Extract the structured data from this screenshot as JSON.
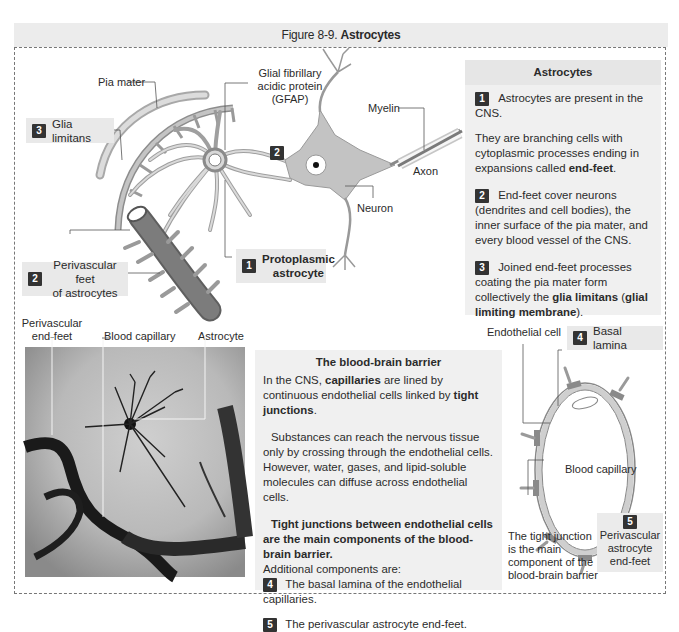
{
  "figure": {
    "title_prefix": "Figure 8-9.",
    "title_bold": "Astrocytes"
  },
  "diagram_labels": {
    "pia_mater": "Pia mater",
    "gfap_line1": "Glial fibrillary",
    "gfap_line2": "acidic protein",
    "gfap_line3": "(GFAP)",
    "myelin": "Myelin",
    "axon": "Axon",
    "neuron": "Neuron",
    "glia_limitans": {
      "badge": "3",
      "text": "Glia limitans"
    },
    "neuron_badge": "2",
    "perivascular_feet": {
      "badge": "2",
      "line1": "Perivascular feet",
      "line2": "of astrocytes"
    },
    "protoplasmic_astrocyte": {
      "badge": "1",
      "line1": "Protoplasmic",
      "line2": "astrocyte"
    }
  },
  "astrocytes_panel": {
    "header": "Astrocytes",
    "item1": {
      "badge": "1",
      "text": "Astrocytes are present in the CNS."
    },
    "para1_a": "They are branching cells with cytoplasmic processes ending in expansions called ",
    "para1_b": "end-feet",
    "para1_c": ".",
    "item2": {
      "badge": "2",
      "text": "End-feet cover neurons (dendrites and cell bodies), the inner surface of the pia mater, and every blood vessel of the CNS."
    },
    "item3": {
      "badge": "3",
      "text_a": "Joined end-feet processes coating the pia mater form collectively the ",
      "text_b": "glia limitans",
      "text_c": " (",
      "text_d": "glial limiting membrane",
      "text_e": ")."
    }
  },
  "micrograph_labels": {
    "perivascular_line1": "Perivascular",
    "perivascular_line2": "end-feet area",
    "blood_capillary": "Blood capillary",
    "astrocyte": "Astrocyte"
  },
  "bbb_panel": {
    "header": "The blood-brain barrier",
    "p1_a": "In the CNS, ",
    "p1_b": "capillaries",
    "p1_c": " are lined by continuous endothelial cells linked by ",
    "p1_d": "tight junctions",
    "p1_e": ".",
    "p2": "Substances can reach the nervous tissue only by crossing through the endothelial cells. However, water, gases, and lipid-soluble molecules can diffuse across endothelial cells.",
    "p3_bold": "Tight junctions between endothelial cells are the main components of the blood-brain barrier.",
    "p3_rest": "Additional components are:",
    "item4": {
      "badge": "4",
      "text": "The basal lamina of the endothelial capillaries."
    },
    "item5": {
      "badge": "5",
      "text": "The perivascular astrocyte end-feet."
    }
  },
  "capillary_labels": {
    "endothelial_cell": "Endothelial cell",
    "basal_lamina": {
      "badge": "4",
      "text": "Basal lamina"
    },
    "blood_capillary": "Blood capillary",
    "tight_junction_l1": "The tight junction",
    "tight_junction_l2": "is the main",
    "tight_junction_l3": "component of the",
    "tight_junction_l4": "blood-brain barrier",
    "perivascular": {
      "badge": "5",
      "line1": "Perivascular",
      "line2": "astrocyte",
      "line3": "end-feet"
    }
  },
  "colors": {
    "badge": "#333333",
    "panel_bg": "#f0f0f0",
    "label_bg": "#e9e9e9",
    "cell_gray": "#bdbdbd",
    "vessel_gray": "#7a7a7a"
  }
}
